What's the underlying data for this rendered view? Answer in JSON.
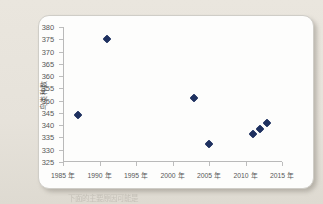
{
  "page": {
    "background_color": "#e8e4dc",
    "card_color": "#fdfdfc",
    "clipped_footer_text": "下面的主要原因可能是"
  },
  "chart_data": {
    "type": "scatter",
    "title": "",
    "subtitle": "",
    "xlabel": "",
    "ylabel": "鸟类种数",
    "xlim": [
      1985,
      2015
    ],
    "ylim": [
      325,
      380
    ],
    "ytick_step": 5,
    "xtick_step": 5,
    "grid": false,
    "legend": false,
    "marker_color": "#1f3160",
    "marker_shape": "diamond",
    "ytick_labels": [
      "380",
      "375",
      "370",
      "365",
      "360",
      "355",
      "350",
      "345",
      "340",
      "335",
      "330",
      "325"
    ],
    "yticks": [
      380,
      375,
      370,
      365,
      360,
      355,
      350,
      345,
      340,
      335,
      330,
      325
    ],
    "xtick_labels": [
      "1985 年",
      "1990 年",
      "1995 年",
      "2000 年",
      "2005 年",
      "2010 年",
      "2015 年"
    ],
    "xticks": [
      1985,
      1990,
      1995,
      2000,
      2005,
      2010,
      2015
    ],
    "points": [
      {
        "x": 1987,
        "y": 344
      },
      {
        "x": 1991,
        "y": 375
      },
      {
        "x": 2003,
        "y": 351
      },
      {
        "x": 2005,
        "y": 332.5
      },
      {
        "x": 2011,
        "y": 336.5
      },
      {
        "x": 2012,
        "y": 338.5
      },
      {
        "x": 2013,
        "y": 341
      }
    ]
  }
}
